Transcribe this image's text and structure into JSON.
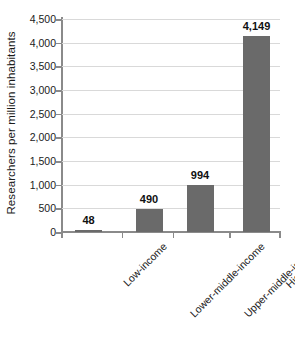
{
  "chart_data": {
    "type": "bar",
    "title": "",
    "xlabel": "",
    "ylabel": "Researchers per million inhabitants",
    "categories": [
      "Low-income",
      "Lower-middle-income",
      "Upper-middle-income",
      "High-income"
    ],
    "values": [
      48,
      490,
      994,
      4149
    ],
    "value_labels": [
      "48",
      "490",
      "994",
      "4,149"
    ],
    "ylim": [
      0,
      4500
    ],
    "ytick_values": [
      0,
      500,
      1000,
      1500,
      2000,
      2500,
      3000,
      3500,
      4000,
      4500
    ],
    "ytick_labels": [
      "0",
      "500",
      "1,000",
      "1,500",
      "2,000",
      "2,500",
      "3,000",
      "3,500",
      "4,000",
      "4,500"
    ],
    "grid": true,
    "legend": "none",
    "bar_color": "#6a6a6a",
    "gridline_color": "#d9d9d9",
    "axis_color": "#8a8a8a",
    "text_color": "#1b1b1b",
    "background_color": "#ffffff"
  }
}
